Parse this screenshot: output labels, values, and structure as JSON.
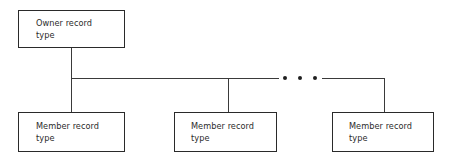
{
  "diagram": {
    "type": "entity-relationship-set-structure",
    "background_color": "#ffffff",
    "line_color": "#3a3a3a",
    "border_color": "#2a2a2a",
    "text_color": "#2b2b2b",
    "nodes": [
      {
        "id": "owner",
        "label": "Owner record\ntype",
        "role": "owner",
        "x": 18,
        "y": 10,
        "width": 107,
        "height": 38
      },
      {
        "id": "member-1",
        "label": "Member record\ntype",
        "role": "member",
        "x": 18,
        "y": 112,
        "width": 107,
        "height": 40
      },
      {
        "id": "member-2",
        "label": "Member record\ntype",
        "role": "member",
        "x": 174,
        "y": 112,
        "width": 103,
        "height": 40
      },
      {
        "id": "member-3",
        "label": "Member record\ntype",
        "role": "member",
        "x": 332,
        "y": 112,
        "width": 102,
        "height": 40
      }
    ],
    "connectors": {
      "owner_stem": "vertical line from owner box down to horizontal bus",
      "bus": "horizontal bus line joining all member stems",
      "member_stems": "vertical lines from bus down into each member box"
    },
    "ellipsis": {
      "label": "• • •",
      "meaning": "additional member record types omitted",
      "dot_count": 3
    }
  }
}
